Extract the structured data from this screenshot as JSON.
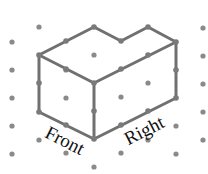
{
  "diagram": {
    "type": "isometric-drawing",
    "colors": {
      "background": "#ffffff",
      "grid_dot": "#8a8a8a",
      "edge": "#707070",
      "vertex": "#7a7a7a",
      "label": "#111111"
    },
    "grid_dots": [
      [
        12,
        42
      ],
      [
        12,
        70
      ],
      [
        12,
        98
      ],
      [
        12,
        126
      ],
      [
        12,
        154
      ],
      [
        39,
        27
      ],
      [
        39,
        140
      ],
      [
        66,
        70
      ],
      [
        66,
        98
      ],
      [
        66,
        153
      ],
      [
        94,
        55
      ],
      [
        94,
        167
      ],
      [
        121,
        97
      ],
      [
        121,
        153
      ],
      [
        148,
        83
      ],
      [
        148,
        140
      ],
      [
        176,
        126
      ],
      [
        176,
        154
      ],
      [
        203,
        28
      ],
      [
        203,
        56
      ],
      [
        203,
        84
      ],
      [
        203,
        112
      ],
      [
        203,
        140
      ]
    ],
    "edges": [
      [
        [
          39,
          55
        ],
        [
          94,
          27
        ]
      ],
      [
        [
          94,
          27
        ],
        [
          121,
          41
        ]
      ],
      [
        [
          121,
          41
        ],
        [
          148,
          27
        ]
      ],
      [
        [
          148,
          27
        ],
        [
          176,
          42
        ]
      ],
      [
        [
          39,
          55
        ],
        [
          94,
          83
        ]
      ],
      [
        [
          94,
          83
        ],
        [
          176,
          42
        ]
      ],
      [
        [
          39,
          55
        ],
        [
          39,
          112
        ]
      ],
      [
        [
          94,
          83
        ],
        [
          94,
          139
        ]
      ],
      [
        [
          176,
          42
        ],
        [
          176,
          98
        ]
      ],
      [
        [
          39,
          112
        ],
        [
          94,
          139
        ]
      ],
      [
        [
          94,
          139
        ],
        [
          176,
          98
        ]
      ]
    ],
    "vertices": [
      [
        39,
        55
      ],
      [
        66,
        41
      ],
      [
        94,
        27
      ],
      [
        121,
        41
      ],
      [
        148,
        27
      ],
      [
        176,
        42
      ],
      [
        66,
        69
      ],
      [
        94,
        83
      ],
      [
        121,
        69
      ],
      [
        148,
        55
      ],
      [
        39,
        83
      ],
      [
        39,
        112
      ],
      [
        176,
        70
      ],
      [
        176,
        98
      ],
      [
        94,
        111
      ],
      [
        66,
        125
      ],
      [
        94,
        139
      ],
      [
        121,
        125
      ],
      [
        148,
        111
      ]
    ],
    "labels": {
      "front": {
        "text": "Front",
        "x": 62,
        "y": 146,
        "rotate": 27
      },
      "right": {
        "text": "Right",
        "x": 147,
        "y": 136,
        "rotate": -27
      }
    }
  }
}
